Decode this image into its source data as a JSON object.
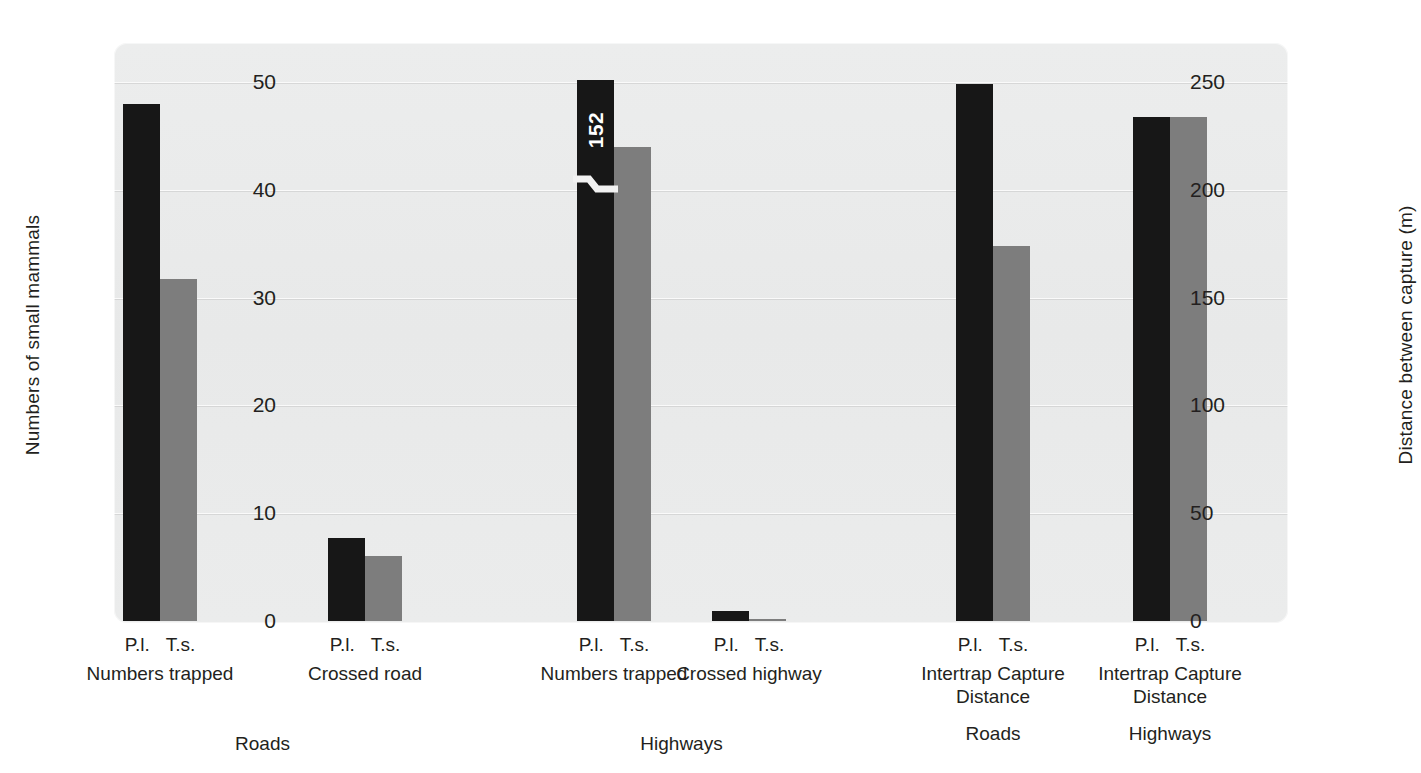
{
  "chart_data": {
    "type": "bar",
    "title": "",
    "ylabel": "Numbers of small mammals",
    "ylabel_right": "Distance between capture (m)",
    "xlabel": "",
    "ylim": [
      0,
      50
    ],
    "ylim_right": [
      0,
      250
    ],
    "grid": true,
    "legend": "none",
    "yticks": [
      "50",
      "40",
      "30",
      "20",
      "10",
      "0"
    ],
    "yticks_right": [
      "250",
      "200",
      "150",
      "100",
      "50",
      "0"
    ],
    "series": [
      {
        "name": "P.l.",
        "color": "#171717"
      },
      {
        "name": "T.s.",
        "color": "#7d7d7d"
      }
    ],
    "groups": [
      {
        "id": "roads-numbers-trapped",
        "measure": "Numbers trapped",
        "context": "Roads",
        "axis": "left",
        "species": [
          "P.l.",
          "T.s."
        ],
        "values": [
          48,
          31.7
        ],
        "clipped": false,
        "value_label": ""
      },
      {
        "id": "roads-crossed-road",
        "measure": "Crossed road",
        "context": "Roads",
        "axis": "left",
        "species": [
          "P.l.",
          "T.s."
        ],
        "values": [
          7.7,
          6
        ],
        "clipped": false,
        "value_label": ""
      },
      {
        "id": "highways-numbers-trapped",
        "measure": "Numbers trapped",
        "context": "Highways",
        "axis": "left",
        "species": [
          "P.l.",
          "T.s."
        ],
        "values": [
          152,
          44
        ],
        "clipped": true,
        "clipped_drawn_value": 50.2,
        "value_label": "152"
      },
      {
        "id": "highways-crossed-highway",
        "measure": "Crossed highway",
        "context": "Highways",
        "axis": "left",
        "species": [
          "P.l.",
          "T.s."
        ],
        "values": [
          0.9,
          0.15
        ],
        "clipped": false,
        "value_label": ""
      },
      {
        "id": "intertrap-capture-distance-roads",
        "measure": "Intertrap Capture Distance",
        "context": "Roads",
        "axis": "right",
        "species": [
          "P.l.",
          "T.s."
        ],
        "values": [
          249,
          174
        ],
        "clipped": false,
        "value_label": ""
      },
      {
        "id": "intertrap-capture-distance-highways",
        "measure": "Intertrap Capture Distance",
        "context": "Highways",
        "axis": "right",
        "species": [
          "P.l.",
          "T.s."
        ],
        "values": [
          234,
          234
        ],
        "clipped": false,
        "value_label": ""
      }
    ]
  },
  "axes": {
    "left": {
      "title": "Numbers of small mammals",
      "ticks": [
        {
          "label": "50"
        },
        {
          "label": "40"
        },
        {
          "label": "30"
        },
        {
          "label": "20"
        },
        {
          "label": "10"
        },
        {
          "label": "0"
        }
      ]
    },
    "right": {
      "title": "Distance between capture (m)",
      "ticks": [
        {
          "label": "250"
        },
        {
          "label": "200"
        },
        {
          "label": "150"
        },
        {
          "label": "100"
        },
        {
          "label": "50"
        },
        {
          "label": "0"
        }
      ]
    }
  },
  "xaxis": {
    "species_pairs": [
      {
        "left": "P.l.",
        "right": "T.s."
      },
      {
        "left": "P.l.",
        "right": "T.s."
      },
      {
        "left": "P.l.",
        "right": "T.s."
      },
      {
        "left": "P.l.",
        "right": "T.s."
      },
      {
        "left": "P.l.",
        "right": "T.s."
      },
      {
        "left": "P.l.",
        "right": "T.s."
      }
    ],
    "measure_labels": [
      {
        "line1": "Numbers trapped",
        "line2": ""
      },
      {
        "line1": "Crossed road",
        "line2": ""
      },
      {
        "line1": "Numbers trapped",
        "line2": ""
      },
      {
        "line1": "Crossed highway",
        "line2": ""
      },
      {
        "line1": "Intertrap Capture",
        "line2": "Distance"
      },
      {
        "line1": "Intertrap Capture",
        "line2": "Distance"
      }
    ],
    "super_labels": [
      {
        "text": "Roads"
      },
      {
        "text": "Highways"
      },
      {
        "text": "Roads"
      },
      {
        "text": "Highways"
      }
    ]
  },
  "colors": {
    "bar_black": "#171717",
    "bar_gray": "#7d7d7d",
    "plot_background": "#eaebeb",
    "gridline": "#fafafa",
    "text": "#231f20",
    "value_label": "#ffffff"
  }
}
